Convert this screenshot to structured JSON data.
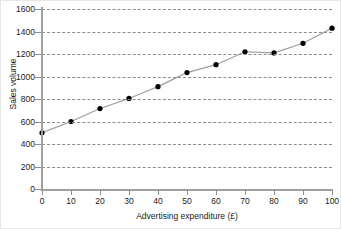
{
  "chart_data": {
    "type": "line",
    "title": "",
    "subtitle": "",
    "xlabel": "Advertising expenditure (£)",
    "ylabel": "Sales volume",
    "x": [
      0,
      10,
      20,
      30,
      40,
      50,
      60,
      70,
      80,
      90,
      100
    ],
    "values": [
      500,
      600,
      715,
      805,
      910,
      1035,
      1105,
      1220,
      1210,
      1295,
      1430
    ],
    "series": [
      {
        "name": "Sales volume",
        "values": [
          500,
          600,
          715,
          805,
          910,
          1035,
          1105,
          1220,
          1210,
          1295,
          1430
        ]
      }
    ],
    "xlim": [
      0,
      100
    ],
    "ylim": [
      0,
      1600
    ],
    "xticks": [
      0,
      10,
      20,
      30,
      40,
      50,
      60,
      70,
      80,
      90,
      100
    ],
    "yticks": [
      0,
      200,
      400,
      600,
      800,
      1000,
      1200,
      1400,
      1600
    ],
    "xtick_labels": [
      "0",
      "10",
      "20",
      "30",
      "40",
      "50",
      "60",
      "70",
      "80",
      "90",
      "100"
    ],
    "ytick_labels": [
      "0",
      "200",
      "400",
      "600",
      "800",
      "1000",
      "1200",
      "1400",
      "1600"
    ],
    "grid": "horizontal-dashed",
    "legend": "none",
    "marker": "filled-circle",
    "line_color": "#9e9e9e",
    "marker_color": "#000000",
    "grid_color": "#8c8c8c",
    "axis_color": "#a0a0a0",
    "background": "#ffffff",
    "annotations": []
  }
}
